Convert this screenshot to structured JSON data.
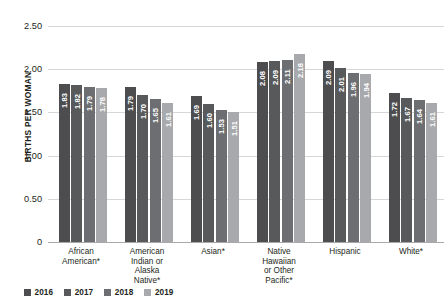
{
  "chart_data": {
    "type": "bar",
    "title": "",
    "xlabel": "",
    "ylabel": "BIRTHS PER WOMAN",
    "ylim": [
      0,
      2.5
    ],
    "yticks": [
      "0",
      "0.50",
      "1.00",
      "1.50",
      "2.00",
      "2.50"
    ],
    "ytick_values": [
      0,
      0.5,
      1.0,
      1.5,
      2.0,
      2.5
    ],
    "grid": true,
    "legend_position": "bottom-left",
    "categories": [
      "African American*",
      "American Indian or Alaska Native*",
      "Asian*",
      "Native Hawaiian or Other Pacific*",
      "Hispanic",
      "White*"
    ],
    "category_lines": [
      [
        "African",
        "American*"
      ],
      [
        "American",
        "Indian or",
        "Alaska",
        "Native*"
      ],
      [
        "Asian*"
      ],
      [
        "Native",
        "Hawaiian",
        "or Other",
        "Pacific*"
      ],
      [
        "Hispanic"
      ],
      [
        "White*"
      ]
    ],
    "series": [
      {
        "name": "2016",
        "color": "#4d4d4f",
        "values": [
          1.83,
          1.79,
          1.69,
          2.08,
          2.09,
          1.72
        ],
        "labels": [
          "1.83",
          "1.79",
          "1.69",
          "2.08",
          "2.09",
          "1.72"
        ]
      },
      {
        "name": "2017",
        "color": "#58595b",
        "values": [
          1.82,
          1.7,
          1.6,
          2.09,
          2.01,
          1.67
        ],
        "labels": [
          "1.82",
          "1.70",
          "1.60",
          "2.09",
          "2.01",
          "1.67"
        ]
      },
      {
        "name": "2018",
        "color": "#6d6e71",
        "values": [
          1.79,
          1.65,
          1.53,
          2.11,
          1.96,
          1.64
        ],
        "labels": [
          "1.79",
          "1.65",
          "1.53",
          "2.11",
          "1.96",
          "1.64"
        ]
      },
      {
        "name": "2019",
        "color": "#a7a9ac",
        "values": [
          1.78,
          1.61,
          1.51,
          2.18,
          1.94,
          1.61
        ],
        "labels": [
          "1.78",
          "1.61",
          "1.51",
          "2.18",
          "1.94",
          "1.61"
        ]
      }
    ]
  }
}
